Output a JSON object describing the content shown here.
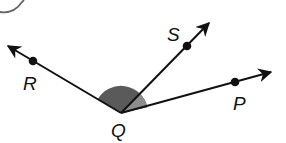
{
  "diagram": {
    "type": "angle-diagram",
    "vertex": {
      "label": "Q",
      "x": 121,
      "y": 113
    },
    "rays": [
      {
        "name": "QR",
        "point_label": "R",
        "point": {
          "x": 33,
          "y": 61
        },
        "arrow_tip": {
          "x": 6,
          "y": 45
        }
      },
      {
        "name": "QS",
        "point_label": "S",
        "point": {
          "x": 187,
          "y": 47
        },
        "arrow_tip": {
          "x": 210,
          "y": 22
        }
      },
      {
        "name": "QP",
        "point_label": "P",
        "point": {
          "x": 235,
          "y": 82
        },
        "arrow_tip": {
          "x": 272,
          "y": 72
        }
      }
    ],
    "shaded_angle": {
      "from": "QR",
      "to": "QP",
      "radius": 27,
      "color": "#5a5a5a",
      "inner_color": "#8a8a8a"
    },
    "labels": {
      "R": "R",
      "S": "S",
      "P": "P",
      "Q": "Q"
    },
    "colors": {
      "line": "#111111",
      "shade_dark": "#5a5a5a",
      "shade_light": "#8c8c8c",
      "circle": "#666666"
    }
  }
}
